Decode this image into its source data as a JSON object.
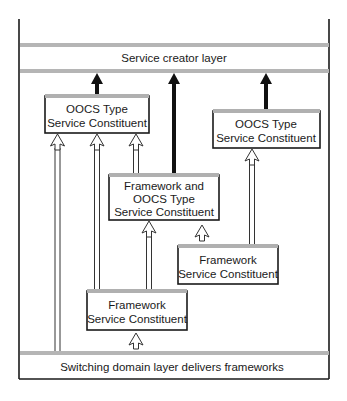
{
  "diagram": {
    "layers": {
      "top": "Service creator layer",
      "bottom": "Switching domain layer delivers frameworks"
    },
    "boxes": [
      {
        "id": "oocs-left",
        "lines": [
          "OOCS Type",
          "Service Constituent"
        ]
      },
      {
        "id": "oocs-right",
        "lines": [
          "OOCS Type",
          "Service Constituent"
        ]
      },
      {
        "id": "framework-oocs-middle",
        "lines": [
          "Framework and",
          "OOCS Type",
          "Service Constituent"
        ]
      },
      {
        "id": "framework-right",
        "lines": [
          "Framework",
          "Service Constituent"
        ]
      },
      {
        "id": "framework-bottom",
        "lines": [
          "Framework",
          "Service Constituent"
        ]
      }
    ],
    "arrows": [
      {
        "type": "thick",
        "from": "oocs-left",
        "to": "top-layer"
      },
      {
        "type": "thick",
        "from": "framework-oocs-middle",
        "to": "top-layer"
      },
      {
        "type": "thick",
        "from": "oocs-right",
        "to": "top-layer"
      },
      {
        "type": "hollow",
        "from": "bottom-layer",
        "to": "oocs-left"
      },
      {
        "type": "hollow",
        "from": "framework-bottom",
        "to": "oocs-left"
      },
      {
        "type": "hollow",
        "from": "framework-oocs-middle",
        "to": "oocs-left"
      },
      {
        "type": "hollow",
        "from": "framework-bottom",
        "to": "framework-oocs-middle"
      },
      {
        "type": "hollow",
        "from": "framework-right",
        "to": "framework-oocs-middle"
      },
      {
        "type": "hollow",
        "from": "framework-right",
        "to": "oocs-right"
      },
      {
        "type": "hollow",
        "from": "bottom-layer",
        "to": "framework-bottom"
      }
    ]
  }
}
